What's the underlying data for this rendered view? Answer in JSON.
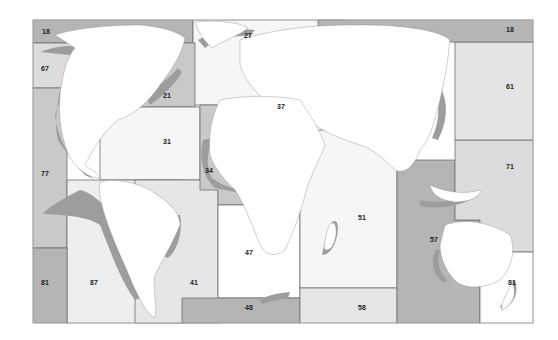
{
  "map": {
    "title": "",
    "colors": {
      "dark_zone": "#b5b5b5",
      "light_zone": "#dcdcdc",
      "white_zone": "#f6f6f6",
      "land": "#ffffff",
      "shelf": "#9d9d9d",
      "border": "#6f6f6f",
      "pale_sea": "#e8e8e8"
    },
    "areas": [
      {
        "code": "18",
        "name": "Arctic Sea (west)",
        "label": "18"
      },
      {
        "code": "67",
        "name": "Pacific, Northeast",
        "label": "67"
      },
      {
        "code": "21",
        "name": "Atlantic, Northwest",
        "label": "21"
      },
      {
        "code": "27",
        "name": "Atlantic, Northeast",
        "label": "27"
      },
      {
        "code": "18",
        "name": "Arctic Sea (east)",
        "label": "18"
      },
      {
        "code": "61",
        "name": "Pacific, Northwest",
        "label": "61"
      },
      {
        "code": "31",
        "name": "Atlantic, Western Central",
        "label": "31"
      },
      {
        "code": "37",
        "name": "Mediterranean and Black Sea",
        "label": "37"
      },
      {
        "code": "77",
        "name": "Pacific, Eastern Central",
        "label": "77"
      },
      {
        "code": "34",
        "name": "Atlantic, Eastern Central",
        "label": "34"
      },
      {
        "code": "71",
        "name": "Pacific, Western Central",
        "label": "71"
      },
      {
        "code": "51",
        "name": "Indian Ocean, Western",
        "label": "51"
      },
      {
        "code": "57",
        "name": "Indian Ocean, Eastern",
        "label": "57"
      },
      {
        "code": "47",
        "name": "Atlantic, Southeast",
        "label": "47"
      },
      {
        "code": "81",
        "name": "Pacific, Southwest (west)",
        "label": "81"
      },
      {
        "code": "87",
        "name": "Pacific, Southeast",
        "label": "87"
      },
      {
        "code": "41",
        "name": "Atlantic, Southwest",
        "label": "41"
      },
      {
        "code": "48",
        "name": "Atlantic, Antarctic",
        "label": "48"
      },
      {
        "code": "58",
        "name": "Indian Ocean, Antarctic",
        "label": "58"
      },
      {
        "code": "81",
        "name": "Pacific, Southwest (east)",
        "label": "81"
      }
    ]
  }
}
